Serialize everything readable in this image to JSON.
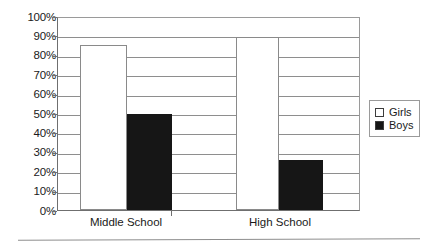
{
  "chart_data": {
    "type": "bar",
    "title": "",
    "subtitle": "",
    "xlabel": "",
    "ylabel": "",
    "categories": [
      "Middle School",
      "High School"
    ],
    "series": [
      {
        "name": "Girls",
        "values": [
          86,
          90
        ],
        "color": "#ffffff"
      },
      {
        "name": "Boys",
        "values": [
          50,
          26
        ],
        "color": "#161616"
      }
    ],
    "ylim": [
      0,
      100
    ],
    "ytick_values": [
      0,
      10,
      20,
      30,
      40,
      50,
      60,
      70,
      80,
      90,
      100
    ],
    "ytick_labels": [
      "0%",
      "10%",
      "20%",
      "30%",
      "40%",
      "50%",
      "60%",
      "70%",
      "80%",
      "90%",
      "100%"
    ],
    "grid": true,
    "grid_axis": "y",
    "legend": {
      "position": "right",
      "entries": [
        {
          "label": "Girls",
          "swatch": "hollow-square-swatch"
        },
        {
          "label": "Boys",
          "swatch": "filled-square-swatch"
        }
      ]
    },
    "colors": {
      "girls_fill": "#ffffff",
      "girls_border": "#8a8a8a",
      "boys_fill": "#161616",
      "axis": "#6f6f6f",
      "grid": "#8e8e8e",
      "text": "#1a1a1a"
    }
  }
}
